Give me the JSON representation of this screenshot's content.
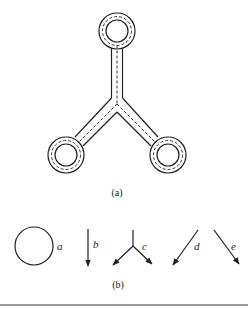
{
  "figure": {
    "part_a": {
      "caption": "(a)",
      "description": "Y-shaped tube network with three ring terminals connected by channels, shown with dashed center lines"
    },
    "part_b": {
      "caption": "(b)",
      "elements": [
        {
          "id": "a",
          "label": "a",
          "shape": "circle"
        },
        {
          "id": "b",
          "label": "b",
          "shape": "downward arrow"
        },
        {
          "id": "c",
          "label": "c",
          "shape": "Y-junction with two diverging arrows"
        },
        {
          "id": "d",
          "label": "d",
          "shape": "arrow pointing down-left"
        },
        {
          "id": "e",
          "label": "e",
          "shape": "arrow pointing down-right"
        }
      ]
    }
  },
  "colors": {
    "line": "#222222",
    "rule": "#9a9a9a",
    "background": "#ffffff"
  }
}
